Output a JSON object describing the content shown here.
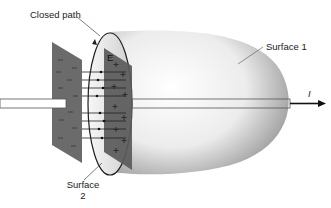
{
  "diagram": {
    "labels": {
      "closed_path": "Closed path",
      "surface1": "Surface 1",
      "surface2_line1": "Surface",
      "surface2_line2": "2",
      "current": "I",
      "field": "E"
    },
    "plates": {
      "left_charge": "−",
      "right_charge": "+"
    },
    "colors": {
      "plate": "#6e6e6e",
      "plate_dark": "#555555",
      "surface_light": "#f2f2f2",
      "surface_shadow": "#9a9a9a",
      "line": "#222222"
    }
  }
}
